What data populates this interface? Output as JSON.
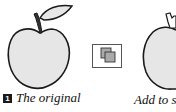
{
  "figure": {
    "left_panel": {
      "step_number": "1",
      "caption": "The original"
    },
    "tool_button": {
      "icon": "add-to-shape-area-icon"
    },
    "right_panel": {
      "caption": "Add to sh"
    },
    "colors": {
      "apple_fill": "#e6e6e6",
      "outline": "#1a1a1a",
      "leaf_fill": "#e6e6e6",
      "button_bg": "#d4d4d4"
    }
  }
}
